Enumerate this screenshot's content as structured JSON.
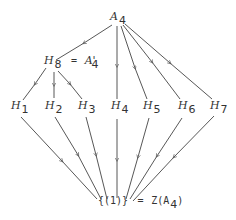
{
  "diagram": {
    "type": "subgroup-lattice",
    "top": {
      "symbol": "A",
      "subscript": "4"
    },
    "middle": {
      "symbol": "H",
      "subscript": "8",
      "equals": "=",
      "alias_symbol": "A",
      "alias_prime": "'",
      "alias_subscript": "4"
    },
    "row": [
      {
        "symbol": "H",
        "subscript": "1"
      },
      {
        "symbol": "H",
        "subscript": "2"
      },
      {
        "symbol": "H",
        "subscript": "3"
      },
      {
        "symbol": "H",
        "subscript": "4"
      },
      {
        "symbol": "H",
        "subscript": "5"
      },
      {
        "symbol": "H",
        "subscript": "6"
      },
      {
        "symbol": "H",
        "subscript": "7"
      }
    ],
    "bottom": {
      "set": "{(1)}",
      "equals": "=",
      "center": "Z(A",
      "subscript": "4",
      "close": ")"
    },
    "edges": [
      [
        "A4",
        "H8"
      ],
      [
        "A4",
        "H4"
      ],
      [
        "A4",
        "H5"
      ],
      [
        "A4",
        "H6"
      ],
      [
        "A4",
        "H7"
      ],
      [
        "H8",
        "H1"
      ],
      [
        "H8",
        "H2"
      ],
      [
        "H8",
        "H3"
      ],
      [
        "H1",
        "{(1)}"
      ],
      [
        "H2",
        "{(1)}"
      ],
      [
        "H3",
        "{(1)}"
      ],
      [
        "H4",
        "{(1)}"
      ],
      [
        "H5",
        "{(1)}"
      ],
      [
        "H6",
        "{(1)}"
      ],
      [
        "H7",
        "{(1)}"
      ]
    ],
    "line_color": "#444444"
  }
}
